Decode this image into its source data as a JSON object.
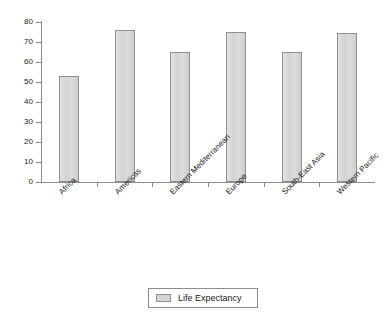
{
  "chart_data": {
    "type": "bar",
    "title": "",
    "xlabel": "",
    "ylabel": "",
    "ylim": [
      0,
      80
    ],
    "yticks": [
      0,
      10,
      20,
      30,
      40,
      50,
      60,
      70,
      80
    ],
    "grid": false,
    "legend_position": "bottom-center",
    "categories": [
      "Africa",
      "Americas",
      "Eastern Mediterranean",
      "Europe",
      "South-East Asia",
      "Western Pacific"
    ],
    "series": [
      {
        "name": "Life Expectancy",
        "values": [
          53,
          76,
          65,
          75,
          65,
          74.5
        ],
        "color": "#d6d6d6",
        "border_color": "#8f8f8f"
      }
    ]
  },
  "legend": {
    "entries": [
      {
        "label": "Life Expectancy",
        "swatch_name": "life-expectancy-swatch"
      }
    ]
  },
  "axis": {
    "y_tick_labels": [
      "80",
      "70",
      "60",
      "50",
      "40",
      "30",
      "20",
      "10",
      "0"
    ],
    "axis_color": "#8c8c8c"
  }
}
